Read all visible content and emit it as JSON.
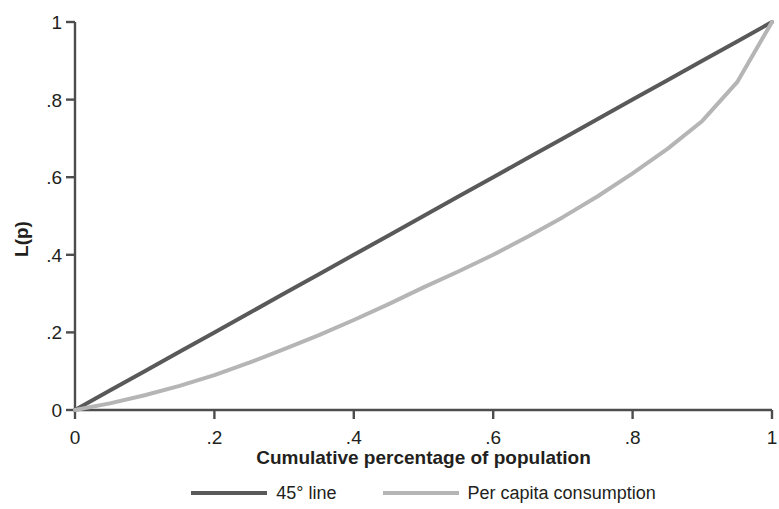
{
  "chart_data": {
    "type": "line",
    "title": "",
    "xlabel": "Cumulative percentage of population",
    "ylabel": "L(p)",
    "xlim": [
      0,
      1
    ],
    "ylim": [
      0,
      1
    ],
    "grid": false,
    "legend_position": "bottom",
    "xticks": [
      "0",
      ".2",
      ".4",
      ".6",
      ".8",
      "1"
    ],
    "xtick_values": [
      0,
      0.2,
      0.4,
      0.6,
      0.8,
      1
    ],
    "yticks": [
      "0",
      ".2",
      ".4",
      ".6",
      ".8",
      "1"
    ],
    "ytick_values": [
      0,
      0.2,
      0.4,
      0.6,
      0.8,
      1
    ],
    "x": [
      0,
      0.05,
      0.1,
      0.15,
      0.2,
      0.25,
      0.3,
      0.35,
      0.4,
      0.45,
      0.5,
      0.55,
      0.6,
      0.65,
      0.7,
      0.75,
      0.8,
      0.85,
      0.9,
      0.95,
      1
    ],
    "series": [
      {
        "name": "45° line",
        "color": "#595959",
        "linewidth": 4,
        "values": [
          0,
          0.05,
          0.1,
          0.15,
          0.2,
          0.25,
          0.3,
          0.35,
          0.4,
          0.45,
          0.5,
          0.55,
          0.6,
          0.65,
          0.7,
          0.75,
          0.8,
          0.85,
          0.9,
          0.95,
          1
        ]
      },
      {
        "name": "Per capita consumption",
        "color": "#b5b5b5",
        "linewidth": 4,
        "values": [
          0,
          0.017,
          0.038,
          0.062,
          0.09,
          0.122,
          0.157,
          0.193,
          0.232,
          0.273,
          0.316,
          0.357,
          0.4,
          0.447,
          0.497,
          0.551,
          0.61,
          0.673,
          0.745,
          0.845,
          1
        ]
      }
    ]
  },
  "axes": {
    "y_title": "L(p)",
    "x_title": "Cumulative percentage of population",
    "axis_color": "#4d4d4d"
  },
  "legend": {
    "items": [
      {
        "label": "45° line",
        "color": "#595959"
      },
      {
        "label": "Per capita consumption",
        "color": "#b5b5b5"
      }
    ]
  }
}
